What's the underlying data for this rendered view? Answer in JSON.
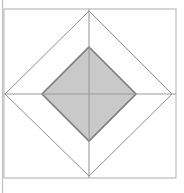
{
  "figure": {
    "canvas": {
      "width": 184,
      "height": 193,
      "background_color": "#ffffff"
    },
    "colors": {
      "page_background": "#ffffff",
      "outer_square_stroke": "#b4b4b4",
      "outer_diamond_stroke": "#8f8f8f",
      "inner_diamond_stroke": "#7d7d7d",
      "inner_diamond_fill": "#c9c9c9",
      "axis_line_stroke": "#9a9a9a",
      "margin_rule_stroke": "#c0c0c0"
    },
    "shapes": {
      "margin_rule": {
        "name": "left-margin-rule",
        "x": 2.5,
        "y_start": 0,
        "y_end": 193,
        "stroke_width": 1.2
      },
      "outer_square": {
        "name": "outer-square",
        "left": 4,
        "top": 9,
        "right": 176,
        "bottom": 178,
        "width": 172,
        "height": 169,
        "stroke_width": 1.1,
        "fill": "none"
      },
      "outer_diamond": {
        "name": "outer-diamond",
        "vertices": [
          {
            "label": "top",
            "x": 89,
            "y": 11
          },
          {
            "label": "right",
            "x": 172,
            "y": 94
          },
          {
            "label": "bottom",
            "x": 89,
            "y": 176
          },
          {
            "label": "left",
            "x": 5,
            "y": 94
          }
        ],
        "stroke_width": 1.0,
        "fill": "none"
      },
      "inner_diamond": {
        "name": "inner-shaded-diamond",
        "vertices": [
          {
            "label": "top",
            "x": 89,
            "y": 47
          },
          {
            "label": "right",
            "x": 136,
            "y": 94
          },
          {
            "label": "bottom",
            "x": 89,
            "y": 141
          },
          {
            "label": "left",
            "x": 42,
            "y": 94
          }
        ],
        "stroke_width": 1.6,
        "fill": "#c9c9c9"
      },
      "horizontal_axis": {
        "name": "horizontal-axis-line",
        "y": 94,
        "x_start": 4,
        "x_end": 176,
        "stroke_width": 1.1
      },
      "vertical_axis": {
        "name": "vertical-axis-line",
        "x": 89,
        "y_start": 9,
        "y_end": 178,
        "stroke_width": 1.1
      }
    }
  }
}
